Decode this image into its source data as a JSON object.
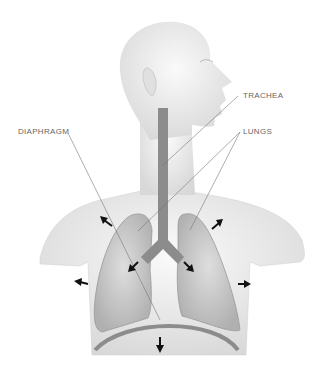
{
  "diagram": {
    "labels": {
      "trachea": "TRACHEA",
      "lungs": "LUNGS",
      "diaphragm": "DIAPHRAGM"
    },
    "colors": {
      "body": "#ececec",
      "organ": "#8c8c8c",
      "lung_fill": "#d4d4d4",
      "leader_line": "#777777",
      "arrow": "#111111",
      "label_text": "#666666"
    }
  }
}
